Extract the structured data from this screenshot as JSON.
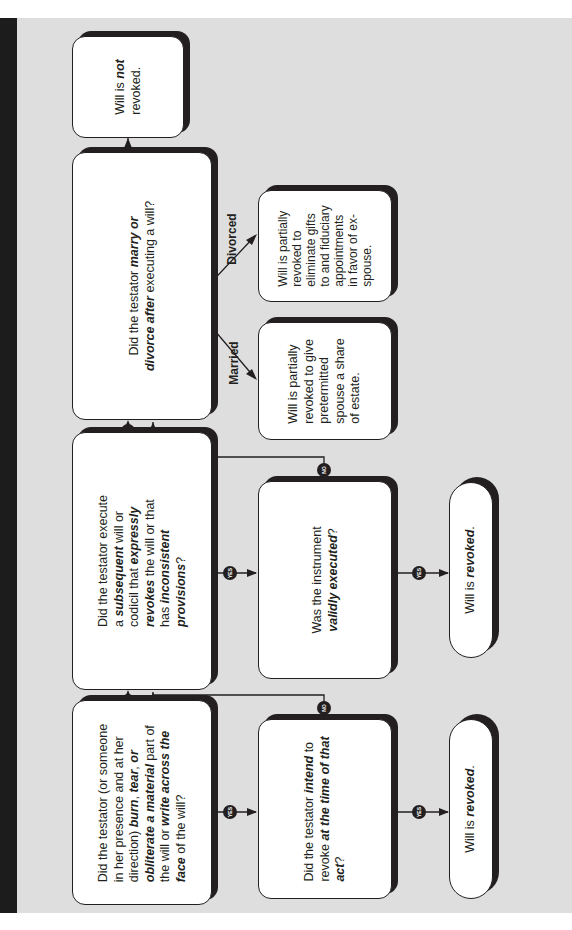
{
  "diagram": {
    "orientation": "rotated-90-ccw",
    "nodes": {
      "q1": {
        "type": "decision",
        "lines": [
          [
            "Did the testator (or someone"
          ],
          [
            "in her presence and at her"
          ],
          [
            "direction) ",
            "burn",
            ", ",
            "tear",
            ", ",
            "or"
          ],
          [
            "obliterate a material",
            " part of"
          ],
          [
            "the will or ",
            "write across the"
          ],
          [
            "face",
            " of the will?"
          ]
        ],
        "text": "Did the testator (or someone in her presence and at her direction) burn, tear, or obliterate a material part of the will or write across the face of the will?"
      },
      "q1_intent": {
        "type": "decision",
        "l1a": "Did the testator ",
        "l1b": "intend",
        "l1c": " to",
        "l2a": "revoke ",
        "l2b": "at the time of that",
        "l3": "act",
        "l3q": "?"
      },
      "r1": {
        "type": "outcome",
        "a": "Will is ",
        "b": "revoked",
        "c": "."
      },
      "q2": {
        "type": "decision",
        "l1": "Did the testator execute",
        "l2a": "a ",
        "l2b": "subsequent",
        "l2c": " will or",
        "l3a": "codicil that ",
        "l3b": "expressly",
        "l4a": "revokes",
        "l4b": " the will or that",
        "l5a": "has ",
        "l5b": "inconsistent",
        "l6": "provisions",
        "l6q": "?"
      },
      "q2_valid": {
        "type": "decision",
        "l1": "Was the instrument",
        "l2": "validly executed",
        "l2q": "?"
      },
      "r2": {
        "type": "outcome",
        "a": "Will is ",
        "b": "revoked",
        "c": "."
      },
      "q3": {
        "type": "decision",
        "l1a": "Did the testator ",
        "l1b": "marry or",
        "l2a": "divorce after",
        "l2b": " executing a will?"
      },
      "married_outcome": {
        "type": "outcome",
        "lines": [
          "Will is partially",
          "revoked to give",
          "pretermitted",
          "spouse a share",
          "of estate."
        ]
      },
      "divorced_outcome": {
        "type": "outcome",
        "lines": [
          "Will is partially",
          "revoked to",
          "eliminate gifts",
          "to and fiduciary",
          "appointments",
          "in favor of ex-",
          "spouse."
        ]
      },
      "not_revoked": {
        "type": "outcome",
        "a": "Will is ",
        "b": "not",
        "c": "revoked."
      }
    },
    "badges": {
      "yes": "YES",
      "no": "NO"
    },
    "branch_labels": {
      "married": "Married",
      "divorced": "Divorced"
    },
    "edges": [
      {
        "from": "q1",
        "to": "q1_intent",
        "label": "YES"
      },
      {
        "from": "q1",
        "to": "q2",
        "label": "NO"
      },
      {
        "from": "q1_intent",
        "to": "r1",
        "label": "YES"
      },
      {
        "from": "q1_intent",
        "to": "q2",
        "label": "NO"
      },
      {
        "from": "q2",
        "to": "q2_valid",
        "label": "YES"
      },
      {
        "from": "q2",
        "to": "q3",
        "label": "NO"
      },
      {
        "from": "q2_valid",
        "to": "r2",
        "label": "YES"
      },
      {
        "from": "q2_valid",
        "to": "q3",
        "label": "NO"
      },
      {
        "from": "q3",
        "to": "married_outcome",
        "label": "Married"
      },
      {
        "from": "q3",
        "to": "divorced_outcome",
        "label": "Divorced"
      },
      {
        "from": "q3",
        "to": "not_revoked",
        "label": "NO"
      }
    ]
  }
}
